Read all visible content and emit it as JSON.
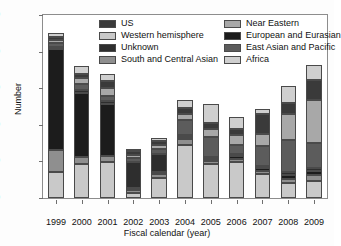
{
  "chart_data": {
    "type": "bar",
    "stacked": true,
    "title": "",
    "xlabel": "Fiscal calendar (year)",
    "ylabel": "Number",
    "categories": [
      "1999",
      "2000",
      "2001",
      "2002",
      "2003",
      "2004",
      "2005",
      "2006",
      "2007",
      "2008",
      "2009"
    ],
    "ylim": [
      0,
      10000
    ],
    "yticks": [
      0,
      2000,
      4000,
      6000,
      8000,
      10000
    ],
    "grid": false,
    "legend_position": "top-inside-two-columns",
    "series": [
      {
        "name": "Western hemisphere",
        "color": "#c9c9c9",
        "values": [
          1400,
          1850,
          1950,
          300,
          1100,
          2900,
          1850,
          1950,
          1300,
          800,
          950
        ]
      },
      {
        "name": "South and Central Asian",
        "color": "#8f8f8f",
        "values": [
          1250,
          400,
          350,
          120,
          200,
          300,
          150,
          200,
          180,
          250,
          300
        ]
      },
      {
        "name": "European and Eurasian",
        "color": "#1c1c1c",
        "values": [
          5500,
          3500,
          2850,
          120,
          120,
          150,
          130,
          150,
          150,
          200,
          250
        ]
      },
      {
        "name": "Unknown",
        "color": "#2e2e2e",
        "values": [
          120,
          130,
          130,
          1450,
          1000,
          120,
          130,
          120,
          130,
          150,
          150
        ]
      },
      {
        "name": "East Asian and Pacific",
        "color": "#5c5c5c",
        "values": [
          180,
          350,
          300,
          200,
          250,
          780,
          1050,
          450,
          1100,
          1750,
          1350
        ]
      },
      {
        "name": "Near Eastern",
        "color": "#a8a8a8",
        "values": [
          160,
          350,
          450,
          180,
          250,
          350,
          450,
          550,
          650,
          1450,
          2350
        ]
      },
      {
        "name": "US",
        "color": "#3a3a3a",
        "values": [
          180,
          200,
          350,
          200,
          200,
          300,
          350,
          350,
          1100,
          600,
          1100
        ]
      },
      {
        "name": "Africa",
        "color": "#cfcfcf",
        "values": [
          210,
          420,
          420,
          130,
          150,
          450,
          1050,
          650,
          240,
          900,
          800
        ]
      }
    ],
    "totals": [
      9000,
      7200,
      6800,
      2700,
      3270,
      5350,
      5160,
      4420,
      4850,
      6100,
      7250
    ]
  },
  "legend": {
    "column_left": [
      {
        "label": "US",
        "swatch": "#3a3a3a"
      },
      {
        "label": "Western hemisphere",
        "swatch": "#c9c9c9"
      },
      {
        "label": "Unknown",
        "swatch": "#2e2e2e"
      },
      {
        "label": "South and Central Asian",
        "swatch": "#8f8f8f"
      }
    ],
    "column_right": [
      {
        "label": "Near Eastern",
        "swatch": "#a8a8a8"
      },
      {
        "label": "European and Eurasian",
        "swatch": "#1c1c1c"
      },
      {
        "label": "East Asian and Pacific",
        "swatch": "#5c5c5c"
      },
      {
        "label": "Africa",
        "swatch": "#cfcfcf"
      }
    ]
  }
}
